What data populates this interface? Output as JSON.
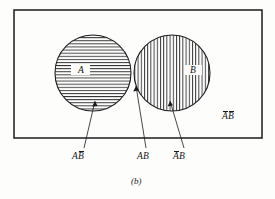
{
  "figure": {
    "caption": "(b)",
    "universe_label": {
      "a_part": "A",
      "b_part": "B",
      "a_bar": true,
      "b_bar": true,
      "text": "AB"
    },
    "sets": [
      {
        "id": "A",
        "label": "A",
        "hatch": "horizontal",
        "cx": 93,
        "cy": 73,
        "r": 38
      },
      {
        "id": "B",
        "label": "B",
        "hatch": "vertical",
        "cx": 172,
        "cy": 73,
        "r": 38
      }
    ],
    "regions": [
      {
        "id": "a-not-b",
        "label_a": "A",
        "label_b": "B",
        "a_bar": false,
        "b_bar": true,
        "hatch": "horizontal",
        "label_x": 80,
        "label_y": 157
      },
      {
        "id": "a-and-b",
        "label_a": "A",
        "label_b": "B",
        "a_bar": false,
        "b_bar": false,
        "hatch": "diagonal",
        "label_x": 144,
        "label_y": 157
      },
      {
        "id": "not-a-and-b",
        "label_a": "A",
        "label_b": "B",
        "a_bar": true,
        "b_bar": false,
        "hatch": "vertical",
        "label_x": 180,
        "label_y": 157
      }
    ],
    "rectangle": {
      "x": 14,
      "y": 10,
      "width": 248,
      "height": 128
    },
    "colors": {
      "stroke": "#1b1b1e",
      "background": "#fdfdfc",
      "hatch": "#1b1b1e"
    }
  }
}
